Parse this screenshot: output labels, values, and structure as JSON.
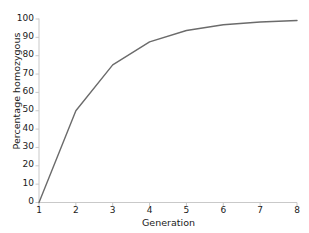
{
  "chart_data": {
    "type": "line",
    "title": "",
    "xlabel": "Generation",
    "ylabel": "Percentage homozygous",
    "x": [
      1,
      2,
      3,
      4,
      5,
      6,
      7,
      8
    ],
    "values": [
      0,
      50,
      75,
      87.5,
      93.75,
      96.9,
      98.4,
      99.2
    ],
    "series": [
      {
        "name": "Percentage homozygous",
        "values": [
          0,
          50,
          75,
          87.5,
          93.75,
          96.9,
          98.4,
          99.2
        ]
      }
    ],
    "xlim": [
      1,
      8
    ],
    "ylim": [
      0,
      100
    ],
    "x_tick_labels": [
      "1",
      "2",
      "3",
      "4",
      "5",
      "6",
      "7",
      "8"
    ],
    "y_tick_labels": [
      "0",
      "10",
      "20",
      "30",
      "40",
      "50",
      "60",
      "70",
      "80",
      "90",
      "100"
    ],
    "y_tick_values": [
      0,
      10,
      20,
      30,
      40,
      50,
      60,
      70,
      80,
      90,
      100
    ],
    "grid": false,
    "legend": "none",
    "line_color": "#6b6b6b",
    "axis_color": "#c9c9c9",
    "background_color": "#ffffff"
  }
}
